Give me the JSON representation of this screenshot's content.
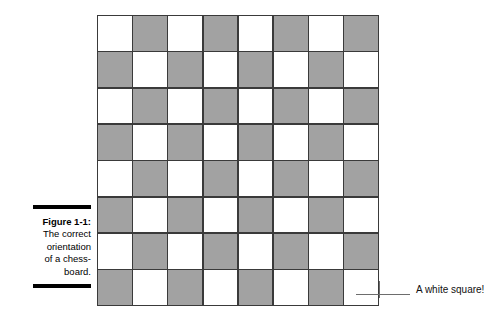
{
  "figure": {
    "caption_title": "Figure 1-1:",
    "caption_lines": [
      "The correct",
      "orientation",
      "of a chess-",
      "board."
    ]
  },
  "callout": {
    "label": "A white square!",
    "line_color": "#6d6d6d"
  },
  "board": {
    "rows": 8,
    "columns": 8,
    "light_color": "#ffffff",
    "dark_color": "#a2a2a2",
    "grid_line_color": "#3a3a3a",
    "top_left_square": "light",
    "bottom_right_square": "light",
    "pattern": [
      [
        "light",
        "dark",
        "light",
        "dark",
        "light",
        "dark",
        "light",
        "dark"
      ],
      [
        "dark",
        "light",
        "dark",
        "light",
        "dark",
        "light",
        "dark",
        "light"
      ],
      [
        "light",
        "dark",
        "light",
        "dark",
        "light",
        "dark",
        "light",
        "dark"
      ],
      [
        "dark",
        "light",
        "dark",
        "light",
        "dark",
        "light",
        "dark",
        "light"
      ],
      [
        "light",
        "dark",
        "light",
        "dark",
        "light",
        "dark",
        "light",
        "dark"
      ],
      [
        "dark",
        "light",
        "dark",
        "light",
        "dark",
        "light",
        "dark",
        "light"
      ],
      [
        "light",
        "dark",
        "light",
        "dark",
        "light",
        "dark",
        "light",
        "dark"
      ],
      [
        "dark",
        "light",
        "dark",
        "light",
        "dark",
        "light",
        "dark",
        "light"
      ]
    ]
  }
}
